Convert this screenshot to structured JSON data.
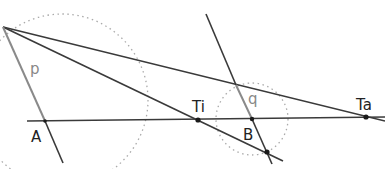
{
  "diagram": {
    "title": "",
    "colors": {
      "line": "#3a3a3a",
      "highlight": "#8a8a8a",
      "dotted": "#aaaaaa",
      "point": "#1a1a1a"
    },
    "labels": {
      "p": "p",
      "q": "q",
      "A": "A",
      "Ti": "Ti",
      "B": "B",
      "Ta": "Ta"
    },
    "points": [
      {
        "name": "A",
        "x": 45,
        "y": 121
      },
      {
        "name": "Ti",
        "x": 198,
        "y": 120
      },
      {
        "name": "B",
        "x": 252,
        "y": 119
      },
      {
        "name": "Ta",
        "x": 366,
        "y": 117
      },
      {
        "name": "lower-intersection",
        "x": 267,
        "y": 152
      }
    ],
    "circles": [
      {
        "name": "large-dotted-circle",
        "cx": 62,
        "cy": 100,
        "r": 86
      },
      {
        "name": "small-dotted-circle",
        "cx": 252,
        "cy": 119,
        "r": 36
      }
    ]
  }
}
